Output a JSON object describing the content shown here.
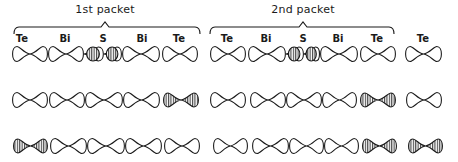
{
  "figure": {
    "packets": [
      {
        "title": "1st packet",
        "title_x": 105,
        "brace": {
          "x1": 14,
          "x2": 200,
          "peak_x": 105
        }
      },
      {
        "title": "2nd packet",
        "title_x": 303,
        "brace": {
          "x1": 210,
          "x2": 394,
          "peak_x": 303
        }
      }
    ],
    "element_labels": [
      {
        "text": "Te",
        "x": 22
      },
      {
        "text": "Bi",
        "x": 65
      },
      {
        "text": "S",
        "x": 103
      },
      {
        "text": "Bi",
        "x": 142
      },
      {
        "text": "Te",
        "x": 179
      },
      {
        "text": "Te",
        "x": 227
      },
      {
        "text": "Bi",
        "x": 266
      },
      {
        "text": "S",
        "x": 303
      },
      {
        "text": "Bi",
        "x": 338
      },
      {
        "text": "Te",
        "x": 377
      },
      {
        "text": "Te",
        "x": 423
      }
    ],
    "rows": [
      {
        "y": 54,
        "orbitals": [
          {
            "x1": 12,
            "x2": 48,
            "style": "plain"
          },
          {
            "x1": 48,
            "x2": 84,
            "style": "plain"
          },
          {
            "x1": 84,
            "x2": 104,
            "style": "hatched-half"
          },
          {
            "x1": 104,
            "x2": 122,
            "style": "hatched-half"
          },
          {
            "x1": 122,
            "x2": 160,
            "style": "plain"
          },
          {
            "x1": 162,
            "x2": 198,
            "style": "plain"
          },
          {
            "x1": 210,
            "x2": 246,
            "style": "plain"
          },
          {
            "x1": 248,
            "x2": 286,
            "style": "plain"
          },
          {
            "x1": 286,
            "x2": 304,
            "style": "hatched-half"
          },
          {
            "x1": 304,
            "x2": 320,
            "style": "hatched-half"
          },
          {
            "x1": 320,
            "x2": 358,
            "style": "plain"
          },
          {
            "x1": 360,
            "x2": 396,
            "style": "plain"
          },
          {
            "x1": 405,
            "x2": 442,
            "style": "plain"
          }
        ]
      },
      {
        "y": 100,
        "orbitals": [
          {
            "x1": 12,
            "x2": 48,
            "style": "plain"
          },
          {
            "x1": 49,
            "x2": 85,
            "style": "plain"
          },
          {
            "x1": 85,
            "x2": 123,
            "style": "plain"
          },
          {
            "x1": 123,
            "x2": 160,
            "style": "plain"
          },
          {
            "x1": 163,
            "x2": 199,
            "style": "hatched"
          },
          {
            "x1": 210,
            "x2": 246,
            "style": "plain"
          },
          {
            "x1": 250,
            "x2": 286,
            "style": "plain"
          },
          {
            "x1": 286,
            "x2": 322,
            "style": "plain"
          },
          {
            "x1": 322,
            "x2": 357,
            "style": "plain"
          },
          {
            "x1": 360,
            "x2": 396,
            "style": "hatched"
          },
          {
            "x1": 406,
            "x2": 442,
            "style": "plain"
          }
        ]
      },
      {
        "y": 146,
        "orbitals": [
          {
            "x1": 13,
            "x2": 48,
            "style": "hatched"
          },
          {
            "x1": 50,
            "x2": 87,
            "style": "plain"
          },
          {
            "x1": 87,
            "x2": 125,
            "style": "plain"
          },
          {
            "x1": 125,
            "x2": 162,
            "style": "plain"
          },
          {
            "x1": 164,
            "x2": 200,
            "style": "plain"
          },
          {
            "x1": 213,
            "x2": 248,
            "style": "plain"
          },
          {
            "x1": 252,
            "x2": 289,
            "style": "plain"
          },
          {
            "x1": 289,
            "x2": 324,
            "style": "plain"
          },
          {
            "x1": 324,
            "x2": 359,
            "style": "plain"
          },
          {
            "x1": 362,
            "x2": 397,
            "style": "hatched"
          },
          {
            "x1": 408,
            "x2": 443,
            "style": "hatched"
          }
        ]
      }
    ]
  }
}
